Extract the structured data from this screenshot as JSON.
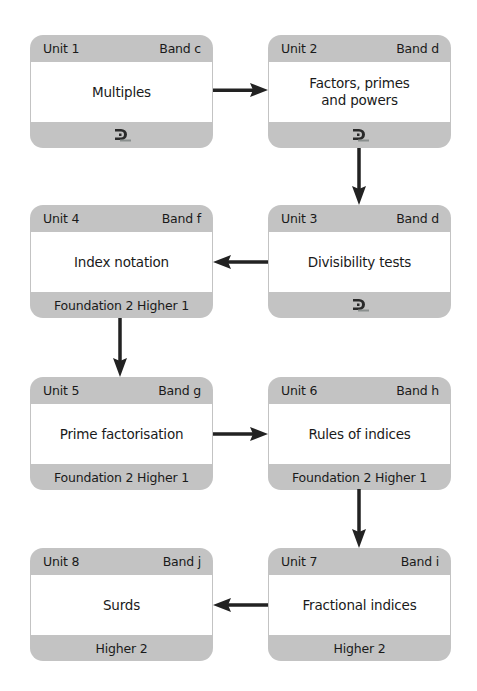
{
  "colors": {
    "box_frame": "#c3c3c3",
    "box_body": "#ffffff",
    "arrow": "#222222",
    "text": "#1a1a1a"
  },
  "units": [
    {
      "unit": "Unit 1",
      "band": "Band c",
      "title": "Multiples",
      "footer_type": "logo",
      "footer": "",
      "footer_icon": "publisher-logo-icon"
    },
    {
      "unit": "Unit 2",
      "band": "Band d",
      "title": "Factors, primes\nand powers",
      "footer_type": "logo",
      "footer": "",
      "footer_icon": "publisher-logo-icon"
    },
    {
      "unit": "Unit 3",
      "band": "Band d",
      "title": "Divisibility tests",
      "footer_type": "logo",
      "footer": "",
      "footer_icon": "publisher-logo-icon"
    },
    {
      "unit": "Unit 4",
      "band": "Band f",
      "title": "Index notation",
      "footer_type": "text",
      "footer": "Foundation 2 Higher 1"
    },
    {
      "unit": "Unit 5",
      "band": "Band g",
      "title": "Prime factorisation",
      "footer_type": "text",
      "footer": "Foundation 2 Higher 1"
    },
    {
      "unit": "Unit 6",
      "band": "Band h",
      "title": "Rules of indices",
      "footer_type": "text",
      "footer": "Foundation 2 Higher 1"
    },
    {
      "unit": "Unit 7",
      "band": "Band i",
      "title": "Fractional indices",
      "footer_type": "text",
      "footer": "Higher 2"
    },
    {
      "unit": "Unit 8",
      "band": "Band j",
      "title": "Surds",
      "footer_type": "text",
      "footer": "Higher 2"
    }
  ],
  "flow": [
    {
      "from": "Unit 1",
      "to": "Unit 2",
      "direction": "right"
    },
    {
      "from": "Unit 2",
      "to": "Unit 3",
      "direction": "down"
    },
    {
      "from": "Unit 3",
      "to": "Unit 4",
      "direction": "left"
    },
    {
      "from": "Unit 4",
      "to": "Unit 5",
      "direction": "down"
    },
    {
      "from": "Unit 5",
      "to": "Unit 6",
      "direction": "right"
    },
    {
      "from": "Unit 6",
      "to": "Unit 7",
      "direction": "down"
    },
    {
      "from": "Unit 7",
      "to": "Unit 8",
      "direction": "left"
    }
  ]
}
